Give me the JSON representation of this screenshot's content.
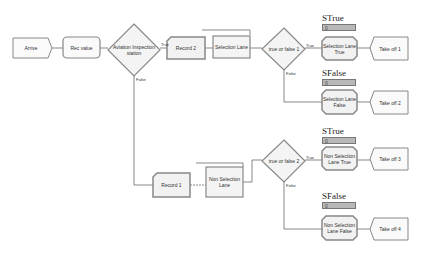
{
  "nodes": {
    "arrive": "Arrive",
    "rec_value": "Rec value",
    "inspection": "Aviation Inspection station",
    "record2": "Record 2",
    "selection_lane": "Selection Lane",
    "tf1": "true or false 1",
    "sel_true": "Selection Lane True",
    "takeoff1": "Take off 1",
    "sel_false": "Selection Lane False",
    "takeoff2": "Take off 2",
    "record1": "Record 1",
    "non_selection_lane": "Non Selection Lane",
    "tf2": "true or false 2",
    "nonsel_true": "Non Selection Lane True",
    "takeoff3": "Take off 3",
    "nonsel_false": "Non Selection Lane False",
    "takeoff4": "Take off 4"
  },
  "variables": {
    "strue1": "STrue",
    "sfalse1": "SFalse",
    "strue2": "STrue",
    "sfalse2": "SFalse",
    "value": "0"
  },
  "branch": {
    "true": "True",
    "false": "False"
  }
}
